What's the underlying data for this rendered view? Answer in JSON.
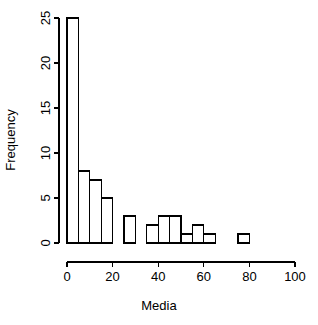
{
  "chart_data": {
    "type": "bar",
    "title": "",
    "subtitle": "",
    "xlabel": "Media",
    "ylabel": "Frequency",
    "xlim": [
      0,
      100
    ],
    "ylim": [
      0,
      25
    ],
    "grid": false,
    "legend": null,
    "bin_width": 5,
    "bin_edges": [
      0,
      5,
      10,
      15,
      20,
      25,
      30,
      35,
      40,
      45,
      50,
      55,
      60,
      65,
      70,
      75,
      80
    ],
    "categories": [
      "0-5",
      "5-10",
      "10-15",
      "15-20",
      "20-25",
      "25-30",
      "30-35",
      "35-40",
      "40-45",
      "45-50",
      "50-55",
      "55-60",
      "60-65",
      "65-70",
      "70-75",
      "75-80"
    ],
    "values": [
      25,
      8,
      7,
      5,
      0,
      3,
      0,
      2,
      3,
      3,
      1,
      2,
      1,
      0,
      0,
      1
    ],
    "x_ticks": [
      0,
      20,
      40,
      60,
      80,
      100
    ],
    "x_tick_labels": [
      "0",
      "20",
      "40",
      "60",
      "80",
      "100"
    ],
    "y_ticks": [
      0,
      5,
      10,
      15,
      20,
      25
    ],
    "y_tick_labels": [
      "0",
      "5",
      "10",
      "15",
      "20",
      "25"
    ],
    "bar_fill_color": "#ffffff",
    "bar_stroke_color": "#000000",
    "axis_color": "#000000",
    "background_color": "#ffffff"
  },
  "axes": {
    "x_title": "Media",
    "y_title": "Frequency"
  }
}
